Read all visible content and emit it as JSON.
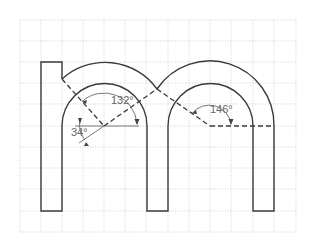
{
  "diagram": {
    "grid": {
      "x_lines": [
        20,
        41,
        62,
        83,
        104,
        125,
        146,
        168,
        189,
        210,
        231,
        253,
        274,
        296
      ],
      "y_lines": [
        20,
        41,
        62,
        83,
        104,
        126,
        147,
        168,
        189,
        211,
        232
      ],
      "color": "#c8c8c8"
    },
    "stroke_color": "#3a3a3a",
    "angles": [
      {
        "id": "angle-132",
        "label": "132°"
      },
      {
        "id": "angle-34",
        "label": "34°"
      },
      {
        "id": "angle-146",
        "label": "146°"
      }
    ]
  }
}
